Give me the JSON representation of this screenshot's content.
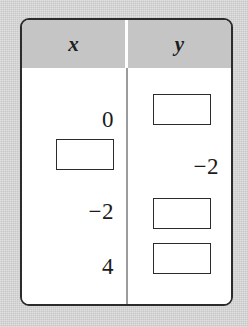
{
  "figure": {
    "type": "two-column-value-table",
    "headers": {
      "x_label": "x",
      "y_label": "y"
    },
    "columns": [
      {
        "name": "x",
        "header": "x",
        "cells": [
          {
            "kind": "value",
            "text": "0"
          },
          {
            "kind": "blank-box",
            "text": ""
          },
          {
            "kind": "value",
            "text": "−2"
          },
          {
            "kind": "value",
            "text": "4"
          }
        ]
      },
      {
        "name": "y",
        "header": "y",
        "cells": [
          {
            "kind": "blank-box",
            "text": ""
          },
          {
            "kind": "value",
            "text": "−2"
          },
          {
            "kind": "blank-box",
            "text": ""
          },
          {
            "kind": "blank-box",
            "text": ""
          }
        ]
      }
    ],
    "colors": {
      "page_background": "#cfcfcf",
      "table_background": "#ffffff",
      "header_band": "#c5c5c5",
      "border": "#2b2b2b",
      "divider": "#9b9b9b",
      "text": "#1b1b1b"
    }
  },
  "chart_data": {
    "type": "table",
    "title": "",
    "columns": [
      "x",
      "y"
    ],
    "rows": [
      [
        "0",
        ""
      ],
      [
        "",
        "−2"
      ],
      [
        "−2",
        ""
      ],
      [
        "4",
        ""
      ]
    ],
    "blank_cells": [
      {
        "column": "x",
        "row_index": 1
      },
      {
        "column": "y",
        "row_index": 0
      },
      {
        "column": "y",
        "row_index": 2
      },
      {
        "column": "y",
        "row_index": 3
      }
    ],
    "xlabel": "x",
    "ylabel": "y",
    "grid": true,
    "legend": "none"
  }
}
